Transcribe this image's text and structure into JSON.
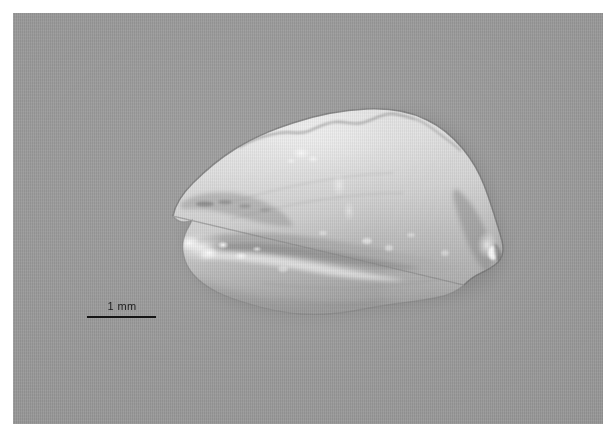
{
  "figure": {
    "domain_kind": "specimen-macro-photograph",
    "background_color": "#969696",
    "plate_border_color": "#ffffff",
    "plate": {
      "left": 13,
      "top": 13,
      "width": 590,
      "height": 411
    }
  },
  "scale_bar": {
    "label": "1 mm",
    "line_length_px": 69,
    "line_color": "#151515",
    "label_color": "#1d1d1d",
    "position": {
      "left": 74,
      "top": 287
    }
  },
  "specimen": {
    "name": "otolith",
    "outline_color": "#6e6e6e",
    "body_light": "#dcdcdc",
    "body_mid": "#bdbdbd",
    "body_shadow": "#8a8a8a",
    "highlight_color": "#ffffff",
    "bounding_box": {
      "left": 155,
      "top": 93,
      "width": 337,
      "height": 209
    },
    "features": [
      {
        "name": "dorsal-margin",
        "description": "crenulated upper edge"
      },
      {
        "name": "rostrum",
        "description": "anterior left projection"
      },
      {
        "name": "excisura",
        "description": "notch below rostrum"
      },
      {
        "name": "sulcus-acusticus",
        "description": "central longitudinal groove"
      },
      {
        "name": "posterior-tip",
        "description": "rounded right point"
      },
      {
        "name": "ventral-margin",
        "description": "lower edge, smooth"
      }
    ]
  }
}
